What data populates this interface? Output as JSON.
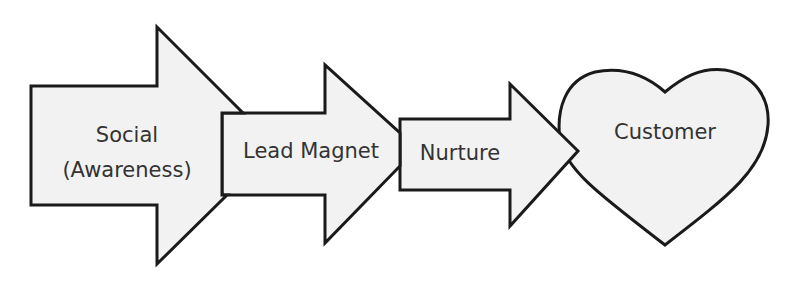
{
  "diagram": {
    "type": "funnel-flow",
    "stages": [
      {
        "id": "social",
        "shape": "block-arrow",
        "label_line1": "Social",
        "label_line2": "(Awareness)"
      },
      {
        "id": "lead-magnet",
        "shape": "block-arrow",
        "label": "Lead Magnet"
      },
      {
        "id": "nurture",
        "shape": "block-arrow",
        "label": "Nurture"
      },
      {
        "id": "customer",
        "shape": "heart",
        "label": "Customer"
      }
    ],
    "colors": {
      "fill": "#f2f2f2",
      "stroke": "#1a1a1a",
      "text": "#333333",
      "background": "#ffffff"
    }
  }
}
